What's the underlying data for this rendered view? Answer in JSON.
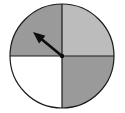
{
  "figure": {
    "name": "spinner-wheel",
    "title": "Spinner divided into four equal sectors with pointer",
    "background_color": "#ffffff",
    "width": 125,
    "height": 113
  },
  "circle": {
    "center_x": 62,
    "center_y": 56,
    "radius": 52,
    "outline_color": "#1a1a1a",
    "outline_width": 1.2
  },
  "sectors": [
    {
      "id": "top-left",
      "label": "Top left sector",
      "start_angle": 180,
      "end_angle": 270,
      "fill": "#9a9a9a",
      "fraction": "1/4"
    },
    {
      "id": "top-right",
      "label": "Top right sector",
      "start_angle": 270,
      "end_angle": 360,
      "fill": "#bcbcbc",
      "fraction": "1/4"
    },
    {
      "id": "bottom-right",
      "label": "Bottom right sector",
      "start_angle": 0,
      "end_angle": 90,
      "fill": "#9a9a9a",
      "fraction": "1/4"
    },
    {
      "id": "bottom-left",
      "label": "Bottom left sector",
      "start_angle": 90,
      "end_angle": 180,
      "fill": "#ffffff",
      "fraction": "1/4"
    }
  ],
  "dividers": {
    "color": "#1a1a1a",
    "width": 1.2,
    "vertical_x": 62,
    "horizontal_y": 56
  },
  "pointer": {
    "label": "Spinner pointer arrow",
    "color": "#0d0d0d",
    "pivot_x": 62,
    "pivot_y": 56,
    "tip_x": 33,
    "tip_y": 32,
    "angle_degrees": 140,
    "shaft_width": 2.6,
    "head_length": 12,
    "head_width": 10
  },
  "chart_data": {
    "type": "pie",
    "title": "Spinner divided into four equal sectors",
    "categories": [
      "Top left",
      "Top right",
      "Bottom right",
      "Bottom left"
    ],
    "values": [
      25,
      25,
      25,
      25
    ],
    "colors": [
      "#9a9a9a",
      "#bcbcbc",
      "#9a9a9a",
      "#ffffff"
    ],
    "legend": "none",
    "xlabel": "",
    "ylabel": "",
    "annotations": [
      "pointer arrow directed toward upper-left sector"
    ]
  }
}
